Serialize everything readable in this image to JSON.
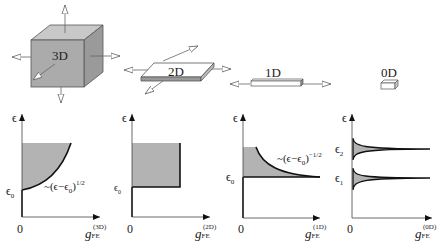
{
  "structures": [
    {
      "label": "3D"
    },
    {
      "label": "2D"
    },
    {
      "label": "1D"
    },
    {
      "label": "0D"
    }
  ],
  "panels": [
    {
      "y_axis": "ϵ",
      "origin": "0",
      "x_axis_main": "g",
      "x_axis_sub": "FE",
      "x_axis_sup": "(3D)",
      "edge_label": "ϵ",
      "edge_sub": "0",
      "formula": "~(ϵ−ϵ",
      "formula_sub": "0",
      "formula_end": ")",
      "formula_exp": "1/2"
    },
    {
      "y_axis": "ϵ",
      "origin": "0",
      "x_axis_main": "g",
      "x_axis_sub": "FE",
      "x_axis_sup": "(2D)",
      "edge_label": "ϵ",
      "edge_sub": "0"
    },
    {
      "y_axis": "ϵ",
      "origin": "0",
      "x_axis_main": "g",
      "x_axis_sub": "FE",
      "x_axis_sup": "(1D)",
      "edge_label": "ϵ",
      "edge_sub": "0",
      "formula": "~(ϵ−ϵ",
      "formula_sub": "0",
      "formula_end": ")",
      "formula_exp": "−1/2"
    },
    {
      "y_axis": "ϵ",
      "origin": "0",
      "x_axis_main": "g",
      "x_axis_sub": "FE",
      "x_axis_sup": "(0D)",
      "levels": [
        {
          "label": "ϵ",
          "sub": "2"
        },
        {
          "label": "ϵ",
          "sub": "1"
        }
      ]
    }
  ],
  "colors": {
    "fill": "#b3b3b3",
    "line": "#111111",
    "box_face": "#a8a8a8"
  }
}
